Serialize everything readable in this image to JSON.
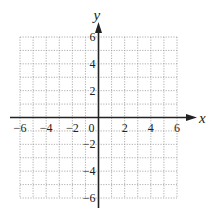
{
  "chart_data": {
    "type": "scatter",
    "title": "",
    "xlabel": "x",
    "ylabel": "y",
    "xlim": [
      -6,
      6
    ],
    "ylim": [
      -6,
      6
    ],
    "grid": true,
    "grid_style": "dotted",
    "grid_step": 1,
    "x_ticks": [
      -6,
      -4,
      -2,
      0,
      2,
      4,
      6
    ],
    "y_ticks": [
      -6,
      -4,
      -2,
      2,
      4,
      6
    ],
    "x_tick_labels": [
      "−6",
      "−4",
      "−2",
      "0",
      "2",
      "4",
      "6"
    ],
    "y_tick_labels": [
      "−6",
      "−4",
      "−2",
      "2",
      "4",
      "6"
    ],
    "series": [],
    "legend": null
  },
  "colors": {
    "axis": "#222222",
    "grid": "#9a9a9a",
    "background": "#ffffff"
  }
}
